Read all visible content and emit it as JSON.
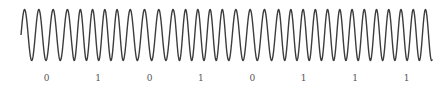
{
  "chart_data": {
    "type": "line",
    "title": "",
    "xlabel": "",
    "ylabel": "",
    "bits": [
      "0",
      "1",
      "0",
      "1",
      "0",
      "1",
      "1",
      "1"
    ],
    "cycles_per_bit": {
      "0": 3.6,
      "1": 4.2
    },
    "grid": false,
    "legend": null,
    "style": {
      "line_color": "#3c3c3c",
      "line_width": 1.4,
      "label_color": "#555555"
    },
    "layout": {
      "x_start": 21,
      "bit_width": 51.4,
      "center_y": 35,
      "amplitude": 25.5,
      "label_y": 81
    }
  }
}
